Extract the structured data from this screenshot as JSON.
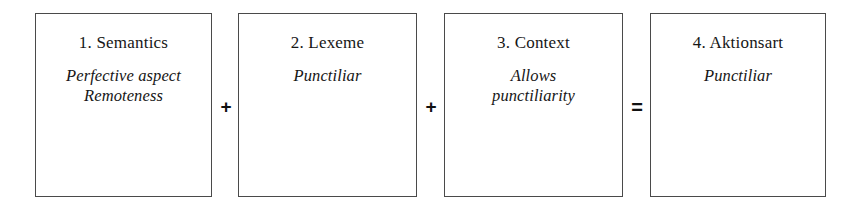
{
  "diagram": {
    "type": "process-flow-equation",
    "background_color": "#ffffff",
    "border_color": "#4a4a4a",
    "text_color": "#161616",
    "nodes": [
      {
        "id": "semantics",
        "heading": "1. Semantics",
        "detail_lines": [
          "Perfective aspect",
          "Remoteness"
        ]
      },
      {
        "id": "lexeme",
        "heading": "2. Lexeme",
        "detail_lines": [
          "Punctiliar"
        ]
      },
      {
        "id": "context",
        "heading": "3. Context",
        "detail_lines": [
          "Allows",
          "punctiliarity"
        ]
      },
      {
        "id": "aktionsart",
        "heading": "4. Aktionsart",
        "detail_lines": [
          "Punctiliar"
        ]
      }
    ],
    "operators": [
      {
        "id": "plus-1",
        "symbol": "+",
        "name": "plus-operator"
      },
      {
        "id": "plus-2",
        "symbol": "+",
        "name": "plus-operator"
      },
      {
        "id": "equals",
        "symbol": "=",
        "name": "equals-operator"
      }
    ]
  }
}
